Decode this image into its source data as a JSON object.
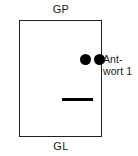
{
  "figure": {
    "background_color": "#ffffff",
    "stroke_color": "#231f20",
    "mark_color": "#000000",
    "width": 138,
    "height": 156
  },
  "labels": {
    "top": "GP",
    "bottom": "GL"
  },
  "annotation": {
    "line_1": "Ant-",
    "line_2": "wort 1",
    "full_text": "Antwort 1"
  },
  "marks": {
    "dots": [
      {
        "id": "dot-1",
        "shape": "filled-circle",
        "x": 60,
        "y": 33,
        "diameter": 11
      },
      {
        "id": "dot-2",
        "shape": "filled-circle",
        "x": 74,
        "y": 33,
        "diameter": 11
      }
    ],
    "dash": {
      "id": "dash-mark",
      "shape": "horizontal-bar",
      "x": 42,
      "y": 77,
      "length": 31,
      "thickness": 3
    }
  }
}
